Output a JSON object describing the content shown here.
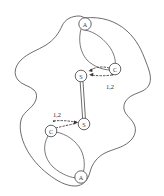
{
  "figure": {
    "background_color": "#ffffff",
    "stroke_color": "#555052",
    "node_fill": "#ffffff",
    "label_color": "#2f2a2c",
    "nodes": [
      {
        "id": "node-a-top",
        "label": "A",
        "x": 85,
        "y": 24,
        "r": 6.2
      },
      {
        "id": "node-c-top",
        "label": "C",
        "x": 115,
        "y": 69,
        "r": 5.8
      },
      {
        "id": "node-s-top",
        "label": "S",
        "x": 81,
        "y": 76,
        "r": 5.8
      },
      {
        "id": "node-s-bottom",
        "label": "S",
        "x": 84,
        "y": 124,
        "r": 5.8
      },
      {
        "id": "node-c-bottom",
        "label": "C",
        "x": 51,
        "y": 131,
        "r": 5.8
      },
      {
        "id": "node-a-bottom",
        "label": "A",
        "x": 81,
        "y": 177,
        "r": 6.2
      }
    ],
    "edges": [
      {
        "id": "edge-s-to-s",
        "type": "double-line",
        "from": "node-s-top",
        "to": "node-s-bottom",
        "label": ""
      },
      {
        "id": "edge-c-to-s-top",
        "type": "dashed-arrow",
        "from": "node-c-top",
        "to": "node-s-top",
        "label": "1,2"
      },
      {
        "id": "edge-c-to-s-bottom",
        "type": "dashed-arrow",
        "from": "node-c-bottom",
        "to": "node-s-bottom",
        "label": "1,2"
      }
    ],
    "edge_labels": [
      {
        "id": "label-top",
        "text": "1,2",
        "x": 110,
        "y": 86
      },
      {
        "id": "label-bottom",
        "text": "1,2",
        "x": 57,
        "y": 114
      }
    ]
  }
}
